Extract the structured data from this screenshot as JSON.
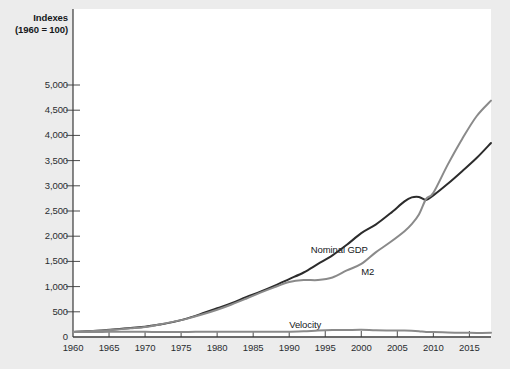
{
  "chart_data": {
    "type": "line",
    "title": "Indexes",
    "title_line2": "(1960 = 100)",
    "xlabel": "",
    "ylabel": "Indexes (1960 = 100)",
    "xlim": [
      1960,
      2018
    ],
    "ylim": [
      0,
      5000
    ],
    "grid": false,
    "legend": "inline-annotations",
    "ytick_labels": [
      "5,000",
      "4,500",
      "4,000",
      "3,500",
      "3,000",
      "2,500",
      "2,000",
      "1,500",
      "1,000",
      "500",
      "0"
    ],
    "ytick_values": [
      5000,
      4500,
      4000,
      3500,
      3000,
      2500,
      2000,
      1500,
      1000,
      500,
      0
    ],
    "xtick_labels": [
      "1960",
      "1965",
      "1970",
      "1975",
      "1980",
      "1985",
      "1990",
      "1995",
      "2000",
      "2005",
      "2010",
      "2015"
    ],
    "xtick_values": [
      1960,
      1965,
      1970,
      1975,
      1980,
      1985,
      1990,
      1995,
      2000,
      2005,
      2010,
      2015
    ],
    "x": [
      1960,
      1962,
      1964,
      1966,
      1968,
      1970,
      1972,
      1974,
      1976,
      1978,
      1980,
      1982,
      1984,
      1986,
      1988,
      1990,
      1992,
      1994,
      1996,
      1998,
      2000,
      2002,
      2004,
      2006,
      2007,
      2008,
      2009,
      2010,
      2012,
      2014,
      2016,
      2018
    ],
    "series": [
      {
        "name": "Nominal GDP",
        "color": "#2c2c2c",
        "label_x": 1993,
        "label_y": 1720,
        "values": [
          100,
          112,
          130,
          152,
          180,
          205,
          248,
          300,
          375,
          470,
          570,
          670,
          790,
          900,
          1020,
          1150,
          1280,
          1450,
          1620,
          1830,
          2060,
          2230,
          2450,
          2690,
          2770,
          2780,
          2720,
          2810,
          3040,
          3290,
          3550,
          3850
        ]
      },
      {
        "name": "M2",
        "color": "#8a8a8a",
        "label_x": 2000,
        "label_y": 1290,
        "values": [
          100,
          112,
          128,
          148,
          172,
          200,
          248,
          305,
          370,
          450,
          540,
          645,
          760,
          880,
          990,
          1090,
          1130,
          1130,
          1180,
          1320,
          1450,
          1680,
          1880,
          2100,
          2240,
          2430,
          2740,
          2860,
          3420,
          3930,
          4380,
          4690
        ]
      },
      {
        "name": "Velocity",
        "color": "#8a8a8a",
        "label_x": 1990,
        "label_y": 230,
        "values": [
          100,
          100,
          101,
          103,
          105,
          103,
          100,
          98,
          101,
          104,
          106,
          104,
          104,
          102,
          103,
          106,
          113,
          128,
          137,
          139,
          142,
          133,
          130,
          128,
          124,
          114,
          99,
          98,
          89,
          84,
          81,
          82
        ]
      }
    ]
  }
}
